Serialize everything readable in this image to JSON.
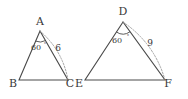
{
  "figure": {
    "kind": "geometry-diagram",
    "background_color": "#ffffff",
    "line_color": "#4a4a4a",
    "dotted_arc_color": "#9a9a9a",
    "text_color": "#3a3a3a"
  },
  "triangles": [
    {
      "id": "triangle-abc",
      "apex_label": "A",
      "left_label": "B",
      "right_label": "C",
      "angle_value": "60",
      "angle_unit": "°",
      "side_label": "6",
      "apex": {
        "x": 40,
        "y": 31
      },
      "left": {
        "x": 19,
        "y": 80
      },
      "right": {
        "x": 68,
        "y": 80
      },
      "apex_label_pos": {
        "x": 40,
        "y": 25
      },
      "left_label_pos": {
        "x": 13,
        "y": 87
      },
      "right_label_pos": {
        "x": 70,
        "y": 87
      },
      "angle_label_pos": {
        "x": 36,
        "y": 50
      },
      "angle_deg_pos": {
        "x": 45,
        "y": 46
      },
      "side_label_pos": {
        "x": 58,
        "y": 51
      },
      "angle_arc": {
        "radius": 11
      },
      "dotted_arc": {
        "bulge": 10
      }
    },
    {
      "id": "triangle-def",
      "apex_label": "D",
      "left_label": "E",
      "right_label": "F",
      "angle_value": "60",
      "angle_unit": "°",
      "side_label": "9",
      "apex": {
        "x": 123,
        "y": 22
      },
      "left": {
        "x": 85,
        "y": 80
      },
      "right": {
        "x": 165,
        "y": 80
      },
      "apex_label_pos": {
        "x": 123,
        "y": 15
      },
      "left_label_pos": {
        "x": 79,
        "y": 87
      },
      "right_label_pos": {
        "x": 168,
        "y": 87
      },
      "angle_label_pos": {
        "x": 117,
        "y": 43
      },
      "angle_deg_pos": {
        "x": 128,
        "y": 38
      },
      "side_label_pos": {
        "x": 150,
        "y": 46
      },
      "angle_arc": {
        "radius": 12
      },
      "dotted_arc": {
        "bulge": 13
      }
    }
  ]
}
